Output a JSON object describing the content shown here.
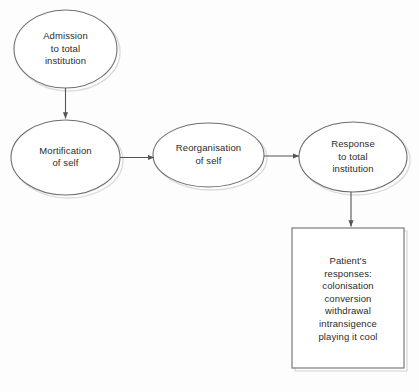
{
  "diagram": {
    "type": "flowchart",
    "background_color": "#fdfdfd",
    "stroke_color": "#6f6f6f",
    "text_color": "#2b2b2b",
    "shadow_color": "#d8d8d8",
    "nodes": [
      {
        "id": "admission",
        "shape": "ellipse",
        "text": "Admission\nto total\ninstitution",
        "cx": 65.5,
        "cy": 49,
        "rx": 51.5,
        "ry": 39
      },
      {
        "id": "mortification",
        "shape": "ellipse",
        "text": "Mortification\nof self",
        "cx": 65.5,
        "cy": 157.5,
        "rx": 54.5,
        "ry": 37.5
      },
      {
        "id": "reorganisation",
        "shape": "ellipse",
        "text": "Reorganisation\nof self",
        "cx": 208.5,
        "cy": 155,
        "rx": 55.5,
        "ry": 32
      },
      {
        "id": "response",
        "shape": "ellipse",
        "text": "Response\nto total\ninstitution",
        "cx": 353,
        "cy": 157,
        "rx": 54,
        "ry": 35
      },
      {
        "id": "patient-responses",
        "shape": "rectangle",
        "text": "Patient's\nresponses:\ncolonisation\nconversion\nwithdrawal\nintransigence\nplaying it cool",
        "x": 292,
        "y": 228,
        "width": 112,
        "height": 140
      }
    ],
    "edges": [
      {
        "id": "admission-to-mortification",
        "from": "admission",
        "to": "mortification",
        "direction": "down",
        "x1": 65.5,
        "y1": 88,
        "x2": 65.5,
        "y2": 120
      },
      {
        "id": "mortification-to-reorganisation",
        "from": "mortification",
        "to": "reorganisation",
        "direction": "right",
        "x1": 120,
        "y1": 157.5,
        "x2": 153,
        "y2": 157.5
      },
      {
        "id": "reorganisation-to-response",
        "from": "reorganisation",
        "to": "response",
        "direction": "right",
        "x1": 264,
        "y1": 156,
        "x2": 299,
        "y2": 156
      },
      {
        "id": "response-to-patient-responses",
        "from": "response",
        "to": "patient-responses",
        "direction": "down",
        "x1": 351,
        "y1": 192,
        "x2": 351,
        "y2": 228
      }
    ]
  }
}
